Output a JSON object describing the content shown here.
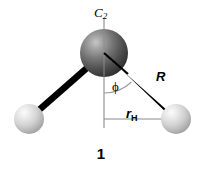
{
  "figure": {
    "caption": "1",
    "background_color": "#ffffff",
    "width": 202,
    "height": 174
  },
  "labels": {
    "symmetry_axis": "C",
    "symmetry_axis_sub": "2",
    "angle": "ϕ",
    "bond_length": "R",
    "h_distance": "r",
    "h_distance_sub": "H"
  },
  "colors": {
    "bond": "#000000",
    "guide_line": "#7d7d7d",
    "central_atom_dark": "#3a3a3a",
    "central_atom_light": "#b9b9b9",
    "hydrogen_dark": "#9c9c9c",
    "hydrogen_light": "#f2f2f2",
    "text": "#000000"
  },
  "geometry": {
    "central_atom": {
      "cx": 104,
      "cy": 53,
      "r": 24
    },
    "hydrogen_left": {
      "cx": 29,
      "cy": 119,
      "r": 15
    },
    "hydrogen_right": {
      "cx": 176,
      "cy": 119,
      "r": 15
    },
    "axis_line": {
      "x": 104,
      "y_top": 19,
      "y_bottom": 128
    },
    "rh_line": {
      "x1": 104,
      "y1": 119,
      "x2": 176,
      "y2": 119
    },
    "angle_arc_radius": 40
  },
  "atoms": [
    {
      "name": "central-atom",
      "element": "O",
      "shade": "dark"
    },
    {
      "name": "hydrogen-left",
      "element": "H",
      "shade": "light"
    },
    {
      "name": "hydrogen-right",
      "element": "H",
      "shade": "light"
    }
  ]
}
